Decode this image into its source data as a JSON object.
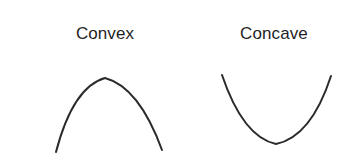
{
  "figure": {
    "width": 345,
    "height": 153,
    "background_color": "#ffffff",
    "stroke_color": "#2b2b2b",
    "stroke_width": 2,
    "text_color": "#1f1f1f"
  },
  "panels": [
    {
      "id": "convex",
      "label": "Convex",
      "curve_name": "downward-opening-parabola",
      "icon_name": "convex-curve-icon",
      "label_center_x": 105,
      "label_baseline_y": 42
    },
    {
      "id": "concave",
      "label": "Concave",
      "curve_name": "upward-opening-parabola",
      "icon_name": "concave-curve-icon",
      "label_center_x": 274,
      "label_baseline_y": 42
    }
  ],
  "chart_data": {
    "type": "line",
    "title": "",
    "xlabel": "",
    "ylabel": "",
    "grid": false,
    "legend_position": "above-each-panel",
    "series": [
      {
        "name": "Convex",
        "shape": "concave-down parabola (opens downward)",
        "vertex": [
          105,
          78
        ],
        "endpoints": [
          [
            56,
            152
          ],
          [
            162,
            150
          ]
        ],
        "svg_path": "M 56 152 Q 73 87 105 78 Q 139 87 162 150"
      },
      {
        "name": "Concave",
        "shape": "concave-up parabola (opens upward)",
        "vertex": [
          276,
          144
        ],
        "endpoints": [
          [
            222,
            75
          ],
          [
            331,
            76
          ]
        ],
        "svg_path": "M 222 75 Q 243 137 276 144 Q 311 137 331 76"
      }
    ]
  }
}
